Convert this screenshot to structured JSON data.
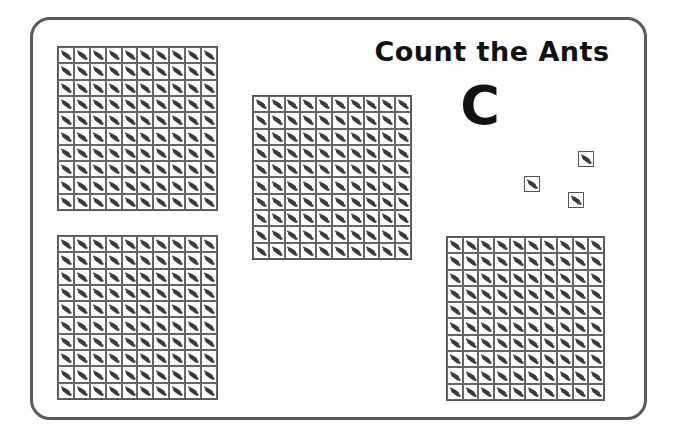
{
  "worksheet": {
    "title": "Count the Ants",
    "letter": "C",
    "colors": {
      "frame_border": "#5a5a5a",
      "text": "#111111",
      "grid_line": "#666666",
      "ant": "#3a3a3a"
    }
  },
  "grids": [
    {
      "id": "grid-top-left",
      "rows": 10,
      "cols": 10,
      "ants": 100,
      "x": 57,
      "y": 46,
      "w": 159,
      "h": 163
    },
    {
      "id": "grid-center",
      "rows": 10,
      "cols": 10,
      "ants": 100,
      "x": 252,
      "y": 95,
      "w": 158,
      "h": 163
    },
    {
      "id": "grid-bottom-left",
      "rows": 10,
      "cols": 10,
      "ants": 100,
      "x": 57,
      "y": 235,
      "w": 159,
      "h": 163
    },
    {
      "id": "grid-bottom-right",
      "rows": 10,
      "cols": 10,
      "ants": 100,
      "x": 446,
      "y": 236,
      "w": 157,
      "h": 163
    }
  ],
  "single_ants": [
    {
      "x": 578,
      "y": 151
    },
    {
      "x": 524,
      "y": 176
    },
    {
      "x": 568,
      "y": 192
    }
  ]
}
